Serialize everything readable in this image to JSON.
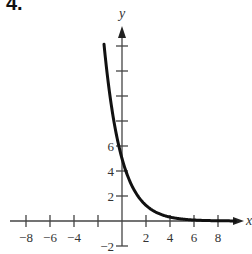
{
  "problem": {
    "number": "4."
  },
  "chart_data": {
    "type": "line",
    "title": "",
    "xlabel": "x",
    "ylabel": "y",
    "xlim": [
      -9,
      10
    ],
    "ylim": [
      -3,
      16
    ],
    "x_ticks": [
      -8,
      -6,
      -4,
      -2,
      2,
      4,
      6,
      8
    ],
    "x_tick_labels": [
      "-8",
      "-6",
      "-4",
      "2",
      "4",
      "6",
      "8"
    ],
    "y_ticks": [
      -2,
      2,
      4,
      6,
      8,
      10,
      12,
      14
    ],
    "y_tick_labels": [
      "-2",
      "2",
      "4",
      "6"
    ],
    "grid": false,
    "series": [
      {
        "name": "y = 5(1/2)^x",
        "x": [
          -1.5,
          -1,
          -0.5,
          0,
          0.5,
          1,
          1.5,
          2,
          3,
          4,
          5,
          6,
          7,
          8,
          9
        ],
        "values": [
          14.1,
          10,
          7.07,
          5,
          3.54,
          2.5,
          1.77,
          1.25,
          0.63,
          0.31,
          0.16,
          0.08,
          0.04,
          0.02,
          0.01
        ]
      }
    ],
    "annotations": [
      "y-intercept at (0, 5)",
      "horizontal asymptote y = 0"
    ]
  }
}
